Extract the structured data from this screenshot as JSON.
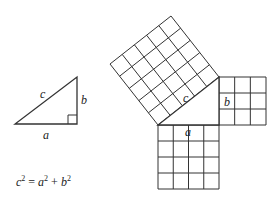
{
  "diagram": {
    "colors": {
      "stroke": "#333333",
      "background": "#ffffff"
    },
    "small_triangle": {
      "labels": {
        "hypotenuse": "c",
        "vertical": "b",
        "base": "a"
      }
    },
    "squares": {
      "c_square": {
        "label": "c",
        "grid": 5
      },
      "b_square": {
        "label": "b",
        "grid": 3
      },
      "a_square": {
        "label": "a",
        "grid": 4
      }
    },
    "equation": {
      "c": "c",
      "a": "a",
      "b": "b",
      "exp": "2",
      "equals": "=",
      "plus": "+"
    }
  }
}
